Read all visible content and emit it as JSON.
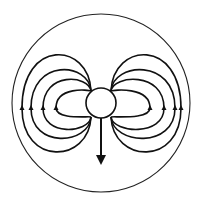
{
  "diagram": {
    "title": "",
    "outer_circle": {
      "cx": 101,
      "cy": 103,
      "r": 89
    },
    "core": {
      "cx": 101,
      "cy": 103,
      "rx": 15,
      "ry": 15
    },
    "arrow": {
      "x": 101,
      "y1": 118,
      "y2": 163,
      "direction": "down"
    },
    "loops_left": [
      {
        "outer_x": 22,
        "top_y": 42,
        "bottom_y": 163,
        "arrow": "up"
      },
      {
        "outer_x": 31,
        "top_y": 62,
        "bottom_y": 145,
        "arrow": "up"
      },
      {
        "outer_x": 43,
        "top_y": 75,
        "bottom_y": 133,
        "arrow": "up"
      },
      {
        "outer_x": 56,
        "top_y": 90,
        "bottom_y": 116,
        "arrow": "up"
      }
    ],
    "loops_right": [
      {
        "outer_x": 181,
        "top_y": 42,
        "bottom_y": 163,
        "arrow": "up"
      },
      {
        "outer_x": 175,
        "top_y": 62,
        "bottom_y": 145,
        "arrow": "up"
      },
      {
        "outer_x": 164,
        "top_y": 75,
        "bottom_y": 133,
        "arrow": "up"
      },
      {
        "outer_x": 150,
        "top_y": 90,
        "bottom_y": 116,
        "arrow": "up"
      }
    ],
    "colors": {
      "stroke": "#111111",
      "background": "#ffffff"
    }
  }
}
